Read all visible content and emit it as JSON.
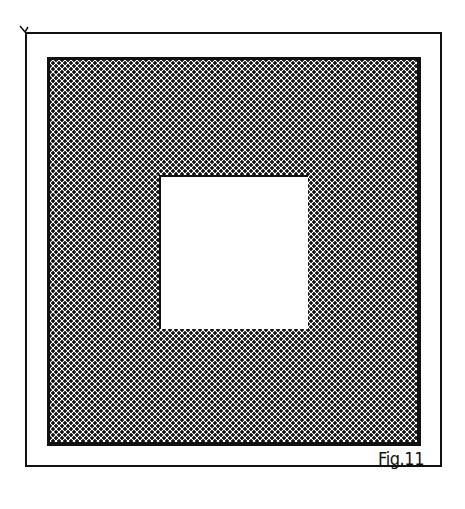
{
  "figure": {
    "caption": "Fig.11",
    "colors": {
      "ink": "#111111",
      "background": "#ffffff"
    }
  }
}
